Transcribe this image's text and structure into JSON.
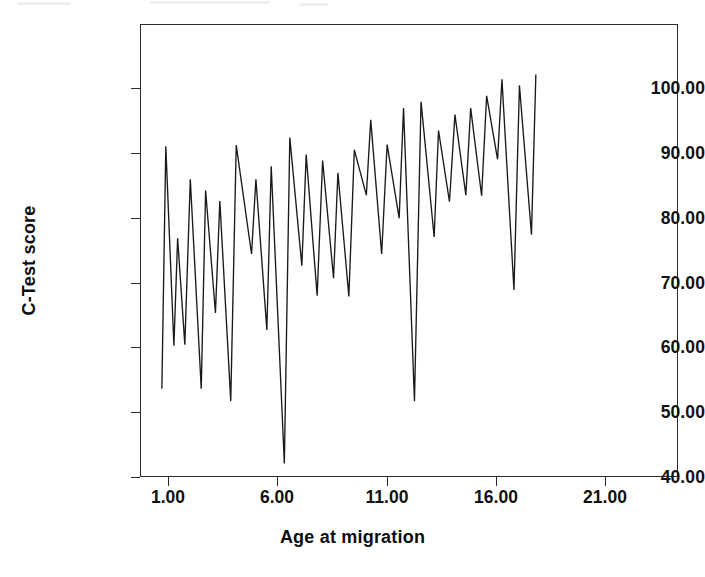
{
  "chart_data": {
    "type": "line",
    "title": "",
    "subtitle": "",
    "xlabel": "Age at migration",
    "ylabel": "C-Test score",
    "xlim": [
      0.0,
      24.6
    ],
    "ylim": [
      30.0,
      107.0
    ],
    "xticks": [
      1.0,
      6.0,
      11.0,
      16.0,
      21.0
    ],
    "xtick_labels": [
      "1.00",
      "6.00",
      "11.00",
      "16.00",
      "21.00"
    ],
    "yticks": [
      30.0,
      40.0,
      50.0,
      60.0,
      70.0,
      80.0,
      90.0,
      100.0
    ],
    "ytick_labels": [
      "30.00",
      "40.00",
      "50.00",
      "60.00",
      "70.00",
      "80.00",
      "90.00",
      "100.00"
    ],
    "grid": false,
    "legend": null,
    "legend_position": "none",
    "line_color": "#1a1a1a",
    "line_width": 1.3,
    "markers": false,
    "series": [
      {
        "name": "C-Test score",
        "x": [
          1.0,
          1.05,
          1.6,
          1.75,
          2.45,
          2.6,
          3.35,
          3.5,
          4.2,
          4.35,
          5.05,
          5.2,
          5.95,
          6.0,
          6.85,
          7.0,
          7.7,
          7.85,
          8.6,
          8.75,
          9.45,
          9.55,
          10.3,
          10.45,
          11.15,
          11.3,
          12.0,
          12.15,
          12.9,
          13.0,
          13.75,
          13.9,
          14.6,
          14.75,
          15.45,
          15.6,
          16.35,
          16.5,
          17.2,
          17.35,
          18.05,
          18.2,
          18.95,
          19.1,
          19.8,
          19.95,
          20.65,
          20.8,
          21.55,
          21.7,
          22.4,
          22.55,
          23.25,
          23.4,
          24.1
        ],
        "y": [
          45.0,
          86.2,
          52.3,
          70.6,
          52.5,
          80.6,
          45.0,
          78.7,
          57.9,
          76.9,
          42.9,
          86.4,
          42.9,
          86.4,
          67.9,
          80.6,
          55.0,
          82.8,
          32.3,
          87.7,
          65.9,
          84.8,
          60.8,
          83.8,
          63.8,
          81.7,
          60.7,
          85.6,
          77.9,
          90.7,
          67.9,
          86.5,
          74.0,
          92.7,
          42.9,
          93.8,
          70.8,
          88.9,
          76.8,
          91.6,
          77.9,
          92.7,
          77.8,
          94.8,
          84.0,
          97.6,
          61.8,
          96.6,
          71.2,
          98.4,
          71.2,
          98.4,
          71.2,
          98.4,
          71.2
        ]
      }
    ],
    "polyline_points": [
      [
        1.0,
        45.0
      ],
      [
        1.18,
        86.2
      ],
      [
        1.55,
        52.3
      ],
      [
        1.72,
        70.6
      ],
      [
        2.05,
        52.5
      ],
      [
        2.3,
        80.6
      ],
      [
        2.8,
        45.0
      ],
      [
        3.0,
        78.7
      ],
      [
        3.45,
        57.9
      ],
      [
        3.65,
        76.9
      ],
      [
        4.15,
        42.9
      ],
      [
        4.4,
        86.4
      ],
      [
        5.1,
        67.9
      ],
      [
        5.3,
        80.6
      ],
      [
        5.8,
        55.0
      ],
      [
        6.0,
        82.8
      ],
      [
        6.6,
        32.3
      ],
      [
        6.85,
        87.7
      ],
      [
        7.4,
        65.9
      ],
      [
        7.6,
        84.8
      ],
      [
        8.1,
        60.8
      ],
      [
        8.35,
        83.8
      ],
      [
        8.85,
        63.8
      ],
      [
        9.05,
        81.7
      ],
      [
        9.55,
        60.7
      ],
      [
        9.8,
        85.6
      ],
      [
        10.35,
        77.9
      ],
      [
        10.55,
        90.7
      ],
      [
        11.05,
        67.9
      ],
      [
        11.3,
        86.5
      ],
      [
        11.85,
        74.0
      ],
      [
        12.05,
        92.7
      ],
      [
        12.55,
        42.9
      ],
      [
        12.85,
        93.8
      ],
      [
        13.45,
        70.8
      ],
      [
        13.65,
        88.9
      ],
      [
        14.15,
        76.8
      ],
      [
        14.4,
        91.6
      ],
      [
        14.9,
        77.9
      ],
      [
        15.12,
        92.7
      ],
      [
        15.62,
        77.8
      ],
      [
        15.85,
        94.8
      ],
      [
        16.35,
        84.0
      ],
      [
        16.55,
        97.6
      ],
      [
        17.1,
        61.8
      ],
      [
        17.35,
        96.6
      ],
      [
        17.9,
        71.2
      ],
      [
        18.1,
        98.4
      ]
    ]
  },
  "axis": {
    "x_title": "Age at migration",
    "y_title": "C-Test score"
  },
  "figure": {
    "background": "#ffffff",
    "frame_color": "#2b2b2b",
    "text_color": "#111111"
  }
}
